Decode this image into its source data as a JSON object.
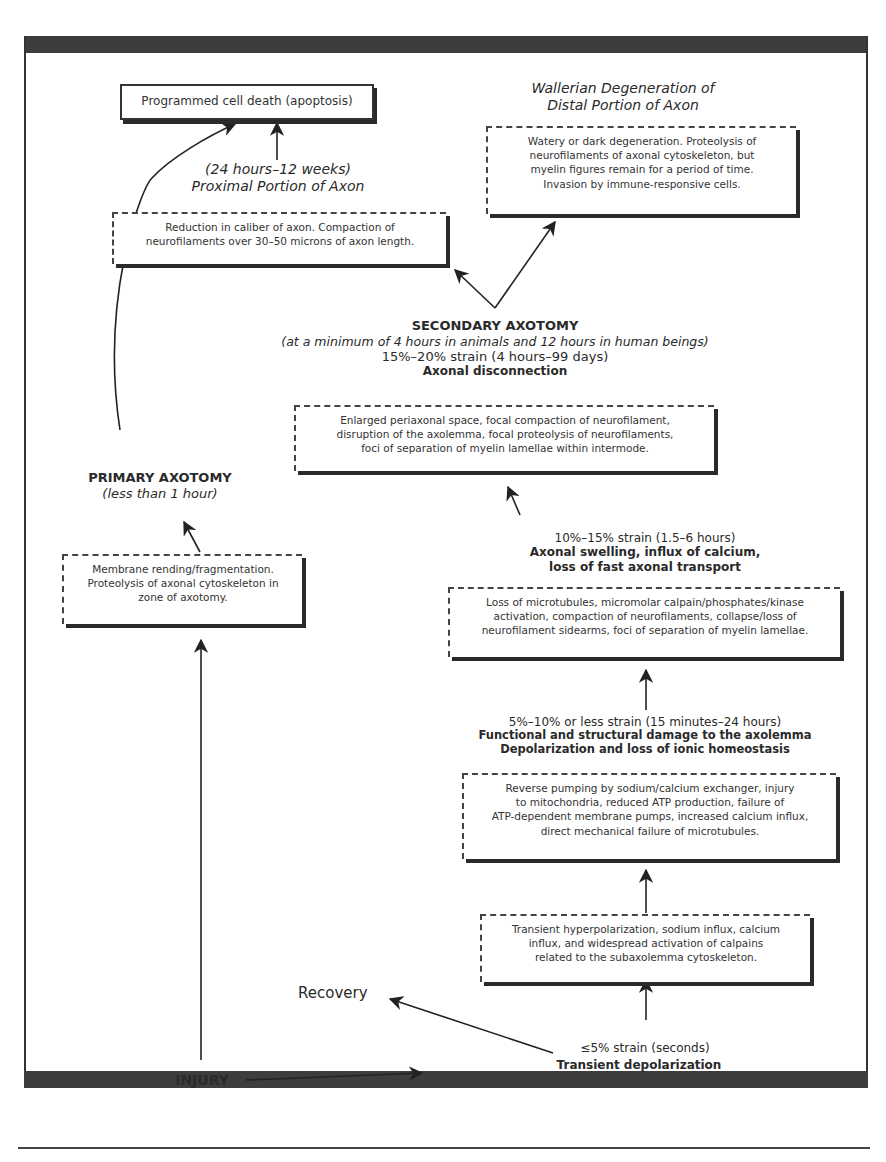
{
  "diagram": {
    "nodes": {
      "apoptosis": "Programmed cell death (apoptosis)",
      "wallerian_title_1": "Wallerian Degeneration of",
      "wallerian_title_2": "Distal Portion of Axon",
      "wallerian_box": [
        "Watery or dark degeneration. Proteolysis of",
        "neurofilaments of axonal cytoskeleton, but",
        "myelin figures remain for a period of time.",
        "Invasion by immune-responsive cells."
      ],
      "proximal_time": "(24 hours–12 weeks)",
      "proximal_title": "Proximal Portion of Axon",
      "proximal_box": [
        "Reduction in caliber of axon. Compaction of",
        "neurofilaments over 30–50 microns of axon length."
      ],
      "secondary_title": "SECONDARY AXOTOMY",
      "secondary_note": "(at a minimum of 4 hours in animals and 12 hours in human beings)",
      "secondary_strain": "15%–20% strain (4 hours–99 days)",
      "secondary_label": "Axonal disconnection",
      "secondary_box": [
        "Enlarged periaxonal space, focal compaction of neurofilament,",
        "disruption of the axolemma, focal proteolysis of neurofilaments,",
        "foci of separation of myelin lamellae within intermode."
      ],
      "primary_title": "PRIMARY AXOTOMY",
      "primary_note": "(less than 1 hour)",
      "primary_box": [
        "Membrane rending/fragmentation.",
        "Proteolysis of axonal cytoskeleton in",
        "zone of axotomy."
      ],
      "swelling_strain": "10%–15% strain (1.5–6 hours)",
      "swelling_label_1": "Axonal swelling, influx of calcium,",
      "swelling_label_2": "loss of fast axonal transport",
      "swelling_box": [
        "Loss of microtubules, micromolar calpain/phosphates/kinase",
        "activation, compaction of neurofilaments, collapse/loss of",
        "neurofilament sidearms, foci of separation of myelin lamellae."
      ],
      "damage_strain": "5%–10% or less strain (15 minutes–24 hours)",
      "damage_label_1": "Functional and structural damage to the axolemma",
      "damage_label_2": "Depolarization and loss of ionic homeostasis",
      "damage_box": [
        "Reverse pumping by sodium/calcium exchanger, injury",
        "to mitochondria, reduced ATP production, failure of",
        "ATP-dependent membrane pumps, increased calcium influx,",
        "direct mechanical failure of microtubules."
      ],
      "transient_box": [
        "Transient hyperpolarization, sodium influx, calcium",
        "influx, and widespread activation of calpains",
        "related to the subaxolemma cytoskeleton."
      ],
      "recovery": "Recovery",
      "mild_strain": "≤5% strain (seconds)",
      "mild_label": "Transient depolarization",
      "injury": "INJURY"
    }
  }
}
